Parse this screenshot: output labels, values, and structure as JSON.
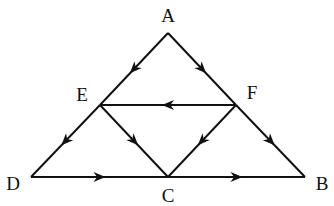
{
  "diagram": {
    "type": "directed-graph",
    "nodes": [
      {
        "id": "A",
        "label": "A",
        "x": 168,
        "y": 33,
        "lx": 168,
        "ly": 22
      },
      {
        "id": "E",
        "label": "E",
        "x": 100,
        "y": 105,
        "lx": 82,
        "ly": 101
      },
      {
        "id": "F",
        "label": "F",
        "x": 236,
        "y": 105,
        "lx": 252,
        "ly": 99
      },
      {
        "id": "D",
        "label": "D",
        "x": 31,
        "y": 177,
        "lx": 13,
        "ly": 190
      },
      {
        "id": "C",
        "label": "C",
        "x": 168,
        "y": 177,
        "lx": 168,
        "ly": 202
      },
      {
        "id": "B",
        "label": "B",
        "x": 305,
        "y": 177,
        "lx": 322,
        "ly": 190
      }
    ],
    "edges": [
      {
        "from": "A",
        "to": "E"
      },
      {
        "from": "A",
        "to": "F"
      },
      {
        "from": "E",
        "to": "D"
      },
      {
        "from": "F",
        "to": "B"
      },
      {
        "from": "F",
        "to": "E"
      },
      {
        "from": "E",
        "to": "C"
      },
      {
        "from": "F",
        "to": "C"
      },
      {
        "from": "D",
        "to": "C"
      },
      {
        "from": "C",
        "to": "B"
      }
    ]
  }
}
